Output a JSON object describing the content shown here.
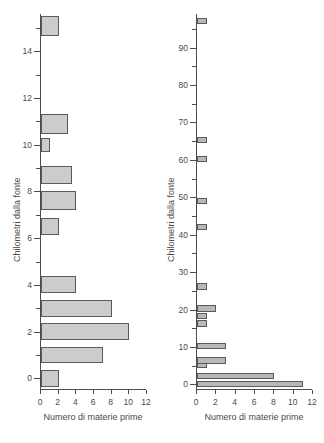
{
  "chart_data": [
    {
      "type": "bar",
      "orientation": "horizontal",
      "panel": "left",
      "title": "",
      "xlabel": "Numero di materie prime",
      "ylabel": "Chilometri dalla fonte",
      "xlim": [
        0,
        12
      ],
      "ylim": [
        -0.5,
        15.6
      ],
      "xticks": [
        0,
        2,
        4,
        6,
        8,
        10,
        12
      ],
      "xticklabels": [
        "0",
        "2",
        "4",
        "6",
        "8",
        "10",
        "12"
      ],
      "yticks": [
        0,
        2,
        4,
        6,
        8,
        10,
        12,
        14
      ],
      "yticklabels": [
        "0",
        "2",
        "4",
        "6",
        "8",
        "10",
        "12",
        "14"
      ],
      "yminorticks": [
        1,
        3,
        5,
        7,
        9,
        11,
        13,
        15
      ],
      "grid": false,
      "legend": null,
      "bar_color": "#cccccc",
      "edge_color": "#5a5a5a",
      "bars": [
        {
          "y": 0.0,
          "height": 0.72,
          "value": 2
        },
        {
          "y": 1.0,
          "height": 0.72,
          "value": 7
        },
        {
          "y": 2.0,
          "height": 0.72,
          "value": 10
        },
        {
          "y": 3.0,
          "height": 0.72,
          "value": 8
        },
        {
          "y": 4.0,
          "height": 0.72,
          "value": 4
        },
        {
          "y": 6.5,
          "height": 0.72,
          "value": 2
        },
        {
          "y": 7.6,
          "height": 0.8,
          "value": 4
        },
        {
          "y": 8.7,
          "height": 0.8,
          "value": 3.5
        },
        {
          "y": 10.0,
          "height": 0.62,
          "value": 1
        },
        {
          "y": 10.9,
          "height": 0.85,
          "value": 3
        },
        {
          "y": 15.1,
          "height": 0.85,
          "value": 2
        }
      ]
    },
    {
      "type": "bar",
      "orientation": "horizontal",
      "panel": "right",
      "title": "",
      "xlabel": "Numero di materie prime",
      "ylabel": "Chilometri dalla fonte",
      "xlim": [
        0,
        12
      ],
      "ylim": [
        -1.5,
        99
      ],
      "xticks": [
        0,
        2,
        4,
        6,
        8,
        10,
        12
      ],
      "xticklabels": [
        "0",
        "2",
        "4",
        "6",
        "8",
        "10",
        "12"
      ],
      "yticks": [
        0,
        10,
        20,
        30,
        40,
        50,
        60,
        70,
        80,
        90
      ],
      "yticklabels": [
        "0",
        "10",
        "20",
        "30",
        "40",
        "50",
        "60",
        "70",
        "80",
        "90"
      ],
      "yminorticks": [
        5,
        15,
        25,
        35,
        45,
        55,
        65,
        75,
        85,
        95
      ],
      "grid": false,
      "legend": null,
      "bar_color": "#b8b8b8",
      "edge_color": "#5a5a5a",
      "bars": [
        {
          "y": 0.0,
          "height": 1.6,
          "value": 11
        },
        {
          "y": 2.3,
          "height": 1.6,
          "value": 8
        },
        {
          "y": 5.2,
          "height": 1.6,
          "value": 1
        },
        {
          "y": 6.3,
          "height": 1.8,
          "value": 3
        },
        {
          "y": 10.2,
          "height": 1.6,
          "value": 3
        },
        {
          "y": 16.3,
          "height": 1.8,
          "value": 1
        },
        {
          "y": 18.4,
          "height": 1.6,
          "value": 1
        },
        {
          "y": 20.3,
          "height": 1.8,
          "value": 2
        },
        {
          "y": 26.2,
          "height": 1.8,
          "value": 1
        },
        {
          "y": 42.0,
          "height": 1.6,
          "value": 1
        },
        {
          "y": 49.0,
          "height": 1.6,
          "value": 1
        },
        {
          "y": 60.2,
          "height": 1.6,
          "value": 1
        },
        {
          "y": 65.2,
          "height": 1.6,
          "value": 1
        },
        {
          "y": 97.2,
          "height": 1.6,
          "value": 1
        }
      ]
    }
  ],
  "left": {
    "xlabel": "Numero di materie prime",
    "ylabel": "Chilometri dalla fonte"
  },
  "right": {
    "xlabel": "Numero di materie prime",
    "ylabel": "Chilometri dalla fonte"
  }
}
